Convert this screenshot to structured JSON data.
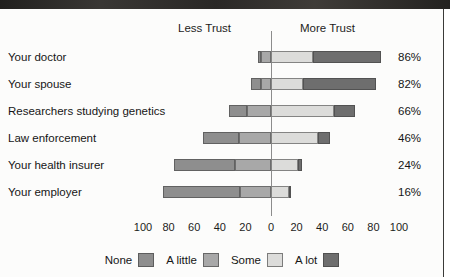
{
  "headings": {
    "less_trust": "Less Trust",
    "more_trust": "More Trust"
  },
  "legend": {
    "items": [
      {
        "label": "None",
        "color": "#8e8e8e"
      },
      {
        "label": "A little",
        "color": "#a8a8a8"
      },
      {
        "label": "Some",
        "color": "#dcdcda"
      },
      {
        "label": "A lot",
        "color": "#6e6e6e"
      }
    ]
  },
  "axis": {
    "tick_labels": [
      "100",
      "80",
      "60",
      "40",
      "20",
      "0",
      "20",
      "40",
      "60",
      "80",
      "100"
    ],
    "tick_values": [
      -100,
      -80,
      -60,
      -40,
      -20,
      0,
      20,
      40,
      60,
      80,
      100
    ],
    "min": -100,
    "max": 100
  },
  "colors": {
    "none": "#8e8e8e",
    "a_little": "#a8a8a8",
    "some": "#dcdcda",
    "a_lot": "#6e6e6e",
    "zero_line": "#8c8c8c",
    "top_band": "#2b2a28",
    "text": "#161616"
  },
  "rows": [
    {
      "label": "Your doctor",
      "value_label": "86%"
    },
    {
      "label": "Your spouse",
      "value_label": "82%"
    },
    {
      "label": "Researchers studying genetics",
      "value_label": "66%"
    },
    {
      "label": "Law enforcement",
      "value_label": "46%"
    },
    {
      "label": "Your health insurer",
      "value_label": "24%"
    },
    {
      "label": "Your employer",
      "value_label": "16%"
    }
  ],
  "chart_data": {
    "type": "bar",
    "subtype": "diverging-stacked-bar",
    "title": "",
    "xlabel": "",
    "ylabel": "",
    "xlim": [
      -100,
      100
    ],
    "grid": false,
    "legend_position": "bottom",
    "left_header": "Less Trust",
    "right_header": "More Trust",
    "categories": [
      "Your doctor",
      "Your spouse",
      "Researchers studying genetics",
      "Law enforcement",
      "Your health insurer",
      "Your employer"
    ],
    "series": [
      {
        "name": "None",
        "side": "left",
        "color": "#8e8e8e",
        "values": [
          2,
          8,
          14,
          28,
          48,
          60
        ]
      },
      {
        "name": "A little",
        "side": "left",
        "color": "#a8a8a8",
        "values": [
          8,
          8,
          19,
          25,
          28,
          24
        ]
      },
      {
        "name": "Some",
        "side": "right",
        "color": "#dcdcda",
        "values": [
          33,
          25,
          49,
          37,
          21,
          14
        ]
      },
      {
        "name": "A lot",
        "side": "right",
        "color": "#6e6e6e",
        "values": [
          53,
          57,
          17,
          9,
          3,
          2
        ]
      }
    ],
    "more_trust_totals": [
      86,
      82,
      66,
      46,
      24,
      16
    ],
    "value_labels": [
      "86%",
      "82%",
      "66%",
      "46%",
      "24%",
      "16%"
    ]
  }
}
